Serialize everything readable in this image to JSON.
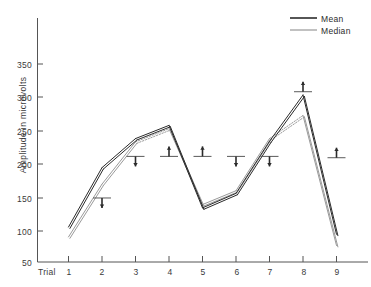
{
  "chart_data": {
    "type": "line",
    "title": "",
    "subtitle": "",
    "xlabel": "Trial",
    "ylabel": "Amplitude in microvolts",
    "categories": [
      "1",
      "2",
      "3",
      "4",
      "5",
      "6",
      "7",
      "8",
      "9"
    ],
    "x": [
      1,
      2,
      3,
      4,
      5,
      6,
      7,
      8,
      9
    ],
    "xlim": [
      0.4,
      9.9
    ],
    "ylim": [
      50,
      385
    ],
    "yticks": [
      50,
      100,
      150,
      200,
      250,
      300,
      350
    ],
    "ytick_labels": [
      "50",
      "100",
      "150",
      "200",
      "250",
      "300",
      "350"
    ],
    "xticks": [
      1,
      2,
      3,
      4,
      5,
      6,
      7,
      8,
      9
    ],
    "xtick_labels": [
      "1",
      "2",
      "3",
      "4",
      "5",
      "6",
      "7",
      "8",
      "9"
    ],
    "grid": false,
    "legend_position": "top-right",
    "series": [
      {
        "name": "Mean",
        "color": "#2b2b2b",
        "values": [
          103,
          193,
          237,
          257,
          132,
          154,
          233,
          303,
          92
        ],
        "dashed_segments": []
      },
      {
        "name": "Median",
        "color": "#9a9a9a",
        "values": [
          88,
          168,
          232,
          252,
          137,
          158,
          237,
          272,
          75
        ],
        "dashed_segments": [
          [
            3,
            4
          ],
          [
            7,
            8
          ]
        ]
      }
    ],
    "markers": [
      {
        "trial": 2,
        "level": 147,
        "arrow": "down"
      },
      {
        "trial": 3,
        "level": 210,
        "arrow": "down"
      },
      {
        "trial": 4,
        "level": 210,
        "arrow": "up"
      },
      {
        "trial": 5,
        "level": 210,
        "arrow": "up"
      },
      {
        "trial": 6,
        "level": 210,
        "arrow": "down"
      },
      {
        "trial": 7,
        "level": 210,
        "arrow": "down"
      },
      {
        "trial": 8,
        "level": 308,
        "arrow": "up"
      },
      {
        "trial": 9,
        "level": 208,
        "arrow": "up"
      }
    ]
  },
  "legend": {
    "items": [
      {
        "label": "Mean",
        "color": "#2b2b2b"
      },
      {
        "label": "Median",
        "color": "#8e8e8e"
      }
    ]
  },
  "axes": {
    "y_title": "Amplitude in microvolts",
    "x_title": "Trial"
  }
}
